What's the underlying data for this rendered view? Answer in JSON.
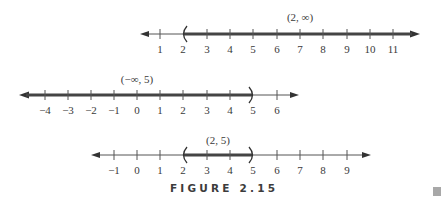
{
  "figure": {
    "caption": "FIGURE 2.15",
    "unit_px": 23.35,
    "colors": {
      "axis": "#555555",
      "interval": "#444444",
      "text": "#3a3a3a",
      "marker": "#a8a8a8"
    },
    "number_lines": [
      {
        "id": "line-1",
        "interval_label": "(2, ∞)",
        "interval": {
          "left": 2,
          "right": "∞",
          "left_type": "open",
          "right_type": "unbounded"
        },
        "ticks": [
          "1",
          "2",
          "3",
          "4",
          "5",
          "6",
          "7",
          "8",
          "9",
          "10",
          "11"
        ],
        "tick_values": [
          1,
          2,
          3,
          4,
          5,
          6,
          7,
          8,
          9,
          10,
          11
        ]
      },
      {
        "id": "line-2",
        "interval_label": "(−∞, 5)",
        "interval": {
          "left": "−∞",
          "right": 5,
          "left_type": "unbounded",
          "right_type": "open"
        },
        "ticks": [
          "−4",
          "−3",
          "−2",
          "−1",
          "0",
          "1",
          "2",
          "3",
          "4",
          "5",
          "6"
        ],
        "tick_values": [
          -4,
          -3,
          -2,
          -1,
          0,
          1,
          2,
          3,
          4,
          5,
          6
        ]
      },
      {
        "id": "line-3",
        "interval_label": "(2, 5)",
        "interval": {
          "left": 2,
          "right": 5,
          "left_type": "open",
          "right_type": "open"
        },
        "ticks": [
          "−1",
          "0",
          "1",
          "2",
          "3",
          "4",
          "5",
          "6",
          "7",
          "8",
          "9"
        ],
        "tick_values": [
          -1,
          0,
          1,
          2,
          3,
          4,
          5,
          6,
          7,
          8,
          9
        ]
      }
    ]
  }
}
